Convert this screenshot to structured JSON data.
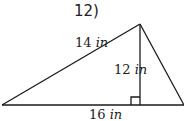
{
  "problem": {
    "number": "12)"
  },
  "diagram": {
    "type": "triangle",
    "labels": {
      "left_side": {
        "value": "14",
        "unit": "in"
      },
      "height": {
        "value": "12",
        "unit": "in"
      },
      "base": {
        "value": "16",
        "unit": "in"
      }
    },
    "right_angle_marker": true,
    "stroke_color": "#1a1a1a"
  }
}
